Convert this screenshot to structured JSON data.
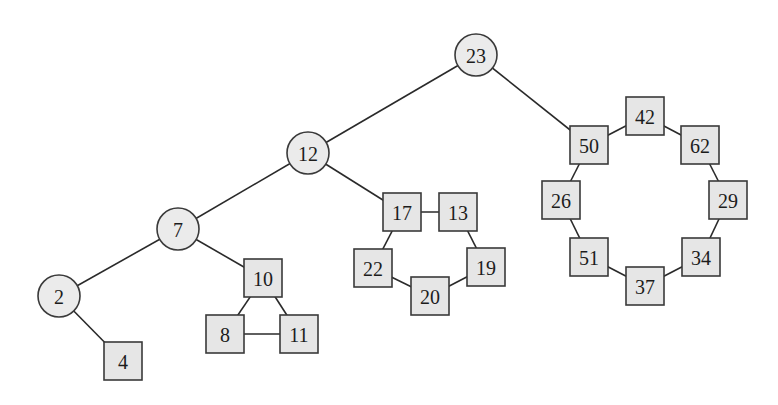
{
  "diagram": {
    "type": "tree-with-cycles",
    "colors": {
      "node_fill_circle": "#ebebeb",
      "node_fill_square": "#e6e6e6",
      "stroke": "#3a3a3a",
      "background": "#ffffff"
    },
    "nodes": [
      {
        "id": "23",
        "label": "23",
        "shape": "circle",
        "x": 476,
        "y": 55
      },
      {
        "id": "12",
        "label": "12",
        "shape": "circle",
        "x": 308,
        "y": 153
      },
      {
        "id": "7",
        "label": "7",
        "shape": "circle",
        "x": 178,
        "y": 229
      },
      {
        "id": "2",
        "label": "2",
        "shape": "circle",
        "x": 59,
        "y": 296
      },
      {
        "id": "4",
        "label": "4",
        "shape": "square",
        "x": 123,
        "y": 361
      },
      {
        "id": "10",
        "label": "10",
        "shape": "square",
        "x": 263,
        "y": 278
      },
      {
        "id": "8",
        "label": "8",
        "shape": "square",
        "x": 225,
        "y": 334
      },
      {
        "id": "11",
        "label": "11",
        "shape": "square",
        "x": 299,
        "y": 334
      },
      {
        "id": "17",
        "label": "17",
        "shape": "square",
        "x": 402,
        "y": 212
      },
      {
        "id": "13",
        "label": "13",
        "shape": "square",
        "x": 458,
        "y": 212
      },
      {
        "id": "22",
        "label": "22",
        "shape": "square",
        "x": 373,
        "y": 268
      },
      {
        "id": "20",
        "label": "20",
        "shape": "square",
        "x": 430,
        "y": 296
      },
      {
        "id": "19",
        "label": "19",
        "shape": "square",
        "x": 486,
        "y": 267
      },
      {
        "id": "50",
        "label": "50",
        "shape": "square",
        "x": 589,
        "y": 145
      },
      {
        "id": "42",
        "label": "42",
        "shape": "square",
        "x": 645,
        "y": 116
      },
      {
        "id": "62",
        "label": "62",
        "shape": "square",
        "x": 700,
        "y": 145
      },
      {
        "id": "26",
        "label": "26",
        "shape": "square",
        "x": 561,
        "y": 200
      },
      {
        "id": "29",
        "label": "29",
        "shape": "square",
        "x": 728,
        "y": 200
      },
      {
        "id": "51",
        "label": "51",
        "shape": "square",
        "x": 589,
        "y": 257
      },
      {
        "id": "34",
        "label": "34",
        "shape": "square",
        "x": 701,
        "y": 257
      },
      {
        "id": "37",
        "label": "37",
        "shape": "square",
        "x": 645,
        "y": 286
      }
    ],
    "edges": [
      [
        "23",
        "12"
      ],
      [
        "23",
        "50"
      ],
      [
        "12",
        "7"
      ],
      [
        "12",
        "17"
      ],
      [
        "7",
        "2"
      ],
      [
        "7",
        "10"
      ],
      [
        "2",
        "4"
      ],
      [
        "10",
        "8"
      ],
      [
        "10",
        "11"
      ],
      [
        "8",
        "11"
      ],
      [
        "17",
        "13"
      ],
      [
        "13",
        "19"
      ],
      [
        "19",
        "20"
      ],
      [
        "20",
        "22"
      ],
      [
        "22",
        "17"
      ],
      [
        "50",
        "42"
      ],
      [
        "42",
        "62"
      ],
      [
        "62",
        "29"
      ],
      [
        "29",
        "34"
      ],
      [
        "34",
        "37"
      ],
      [
        "37",
        "51"
      ],
      [
        "51",
        "26"
      ],
      [
        "26",
        "50"
      ]
    ],
    "circle_radius": 21,
    "square_size": 38
  }
}
